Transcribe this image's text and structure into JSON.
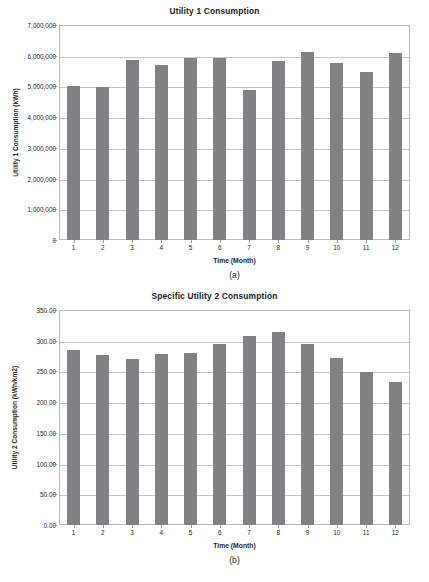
{
  "figure": {
    "panels": [
      {
        "caption": "(a)",
        "chart_data": {
          "type": "bar",
          "title": "Utility 1 Consumption",
          "xlabel": "Time (Month)",
          "ylabel": "Utility 1 Consumption (kWh)",
          "categories": [
            "1",
            "2",
            "3",
            "4",
            "5",
            "6",
            "7",
            "8",
            "9",
            "10",
            "11",
            "12"
          ],
          "values": [
            5030000,
            4990000,
            5850000,
            5700000,
            5920000,
            5940000,
            4900000,
            5830000,
            6120000,
            5750000,
            5470000,
            6090000
          ],
          "ylim": [
            0,
            7000000
          ],
          "ytick_labels": [
            "0",
            "1,000,000",
            "2,000,000",
            "3,000,000",
            "4,000,000",
            "5,000,000",
            "6,000,000",
            "7,000,000"
          ],
          "ytick_values": [
            0,
            1000000,
            2000000,
            3000000,
            4000000,
            5000000,
            6000000,
            7000000
          ],
          "grid": true,
          "legend": "none",
          "bar_color": "#808183",
          "frame_color": "#b9bbbd",
          "grid_color": "#c4c6c8"
        }
      },
      {
        "caption": "(b)",
        "chart_data": {
          "type": "bar",
          "title": "Specific Utility 2 Consumption",
          "xlabel": "Time (Month)",
          "ylabel": "Utility 2 Consumption (kWh/km2)",
          "categories": [
            "1",
            "2",
            "3",
            "4",
            "5",
            "6",
            "7",
            "8",
            "9",
            "10",
            "11",
            "12"
          ],
          "values": [
            285.0,
            277.0,
            270.0,
            278.0,
            280.0,
            295.0,
            308.0,
            314.0,
            294.0,
            272.0,
            249.0,
            233.0
          ],
          "ylim": [
            0,
            350
          ],
          "ytick_labels": [
            "0.00",
            "50.00",
            "100.00",
            "150.00",
            "200.00",
            "250.00",
            "300.00",
            "350.00"
          ],
          "ytick_values": [
            0,
            50,
            100,
            150,
            200,
            250,
            300,
            350
          ],
          "grid": true,
          "legend": "none",
          "bar_color": "#808183",
          "frame_color": "#b9bbbd",
          "grid_color": "#c4c6c8"
        }
      }
    ]
  }
}
